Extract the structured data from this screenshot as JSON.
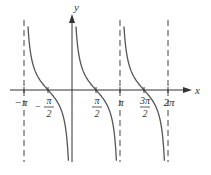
{
  "chart_data": {
    "type": "line",
    "title": "",
    "function": "cot(x)",
    "xlabel": "x",
    "ylabel": "y",
    "xlim": [
      -3.6,
      7.2
    ],
    "ylim": [
      -4,
      4
    ],
    "grid": false,
    "asymptotes": [
      -3.14159,
      0,
      3.14159,
      6.28319
    ],
    "series": [
      {
        "name": "y = cot x",
        "branches": [
          [
            -3.14159,
            0
          ],
          [
            0,
            3.14159
          ],
          [
            3.14159,
            6.28319
          ]
        ]
      }
    ],
    "x_ticks": [
      {
        "value": -3.14159,
        "label": "−π"
      },
      {
        "value": -1.5708,
        "label_num": "π",
        "label_den": "2",
        "sign": "−"
      },
      {
        "value": 1.5708,
        "label_num": "π",
        "label_den": "2",
        "sign": ""
      },
      {
        "value": 3.14159,
        "label": "π"
      },
      {
        "value": 4.7124,
        "label_num": "3π",
        "label_den": "2",
        "sign": ""
      },
      {
        "value": 6.28319,
        "label": "2π"
      }
    ]
  }
}
